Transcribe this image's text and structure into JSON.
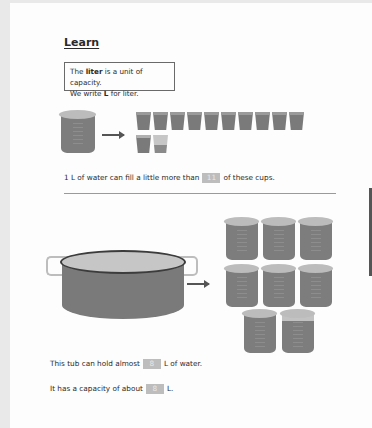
{
  "lesson": {
    "heading": "Learn",
    "definition": {
      "line1_pre": "The ",
      "line1_bold": "liter",
      "line1_post": " is a unit of capacity.",
      "line2_pre": "We write ",
      "line2_bold": "L",
      "line2_post": " for liter."
    },
    "cups_section": {
      "full_cups": 11,
      "partial_cups": 1,
      "sentence_pre": "1 L of water can fill a little more than",
      "answer": "11",
      "sentence_post": "of these cups."
    },
    "tub_section": {
      "liter_beakers": 8,
      "sentence1_pre": "This tub can hold almost",
      "sentence1_answer": "8",
      "sentence1_post": "L of water.",
      "sentence2_pre": "It has a capacity of about",
      "sentence2_answer": "8",
      "sentence2_post": "L."
    }
  },
  "icons": {
    "beaker": "liter-beaker-icon",
    "cup": "cup-icon",
    "tub": "tub-icon",
    "arrow": "right-arrow-icon"
  },
  "colors": {
    "liquid": "#7a7a7a",
    "lid": "#bcbcbc",
    "text": "#2a2a2a",
    "answer_box": "#bdbdbd"
  }
}
